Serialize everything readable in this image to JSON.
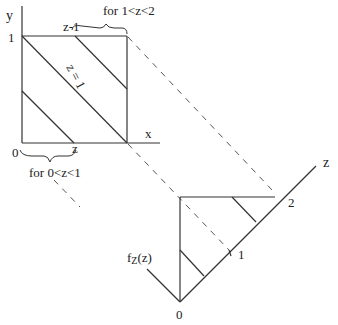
{
  "diagram": {
    "type": "geometry-transform",
    "square": {
      "axis_y_label": "y",
      "axis_x_label": "x",
      "origin_label": "0",
      "y_tick_label": "1",
      "diagonal_label": "z = 1",
      "upper_intercept_label": "z-1",
      "lower_intercept_label": "z",
      "upper_brace_label": "for 1<z<2",
      "lower_brace_label": "for 0<z<1"
    },
    "density": {
      "axis_label": "z",
      "function_label": "f",
      "function_subscript": "Z",
      "function_arg": "(z)",
      "origin_label": "0",
      "tick_1_label": "1",
      "tick_2_label": "2"
    }
  }
}
